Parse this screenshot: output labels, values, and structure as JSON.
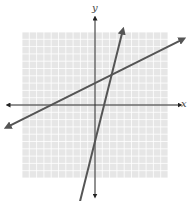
{
  "chart_data": {
    "type": "line",
    "title": "",
    "xlabel": "x",
    "ylabel": "y",
    "xlim": [
      -10,
      10
    ],
    "ylim": [
      -10,
      10
    ],
    "grid": true,
    "tick_labels": false,
    "series": [
      {
        "name": "line 1",
        "slope": 0.5,
        "intercept": 3,
        "note": "shallow line crossing x-axis near -6, y-axis at 3"
      },
      {
        "name": "line 2",
        "slope": 4,
        "intercept": -5,
        "note": "steep line crossing y-axis near -5"
      }
    ],
    "intersection": [
      2,
      4
    ],
    "colors": {
      "lines": "#555555",
      "grid": "#ffffff",
      "grid_bg": "#e6e6e6",
      "axes": "#222222"
    }
  },
  "axes": {
    "x_label": "x",
    "y_label": "y"
  }
}
